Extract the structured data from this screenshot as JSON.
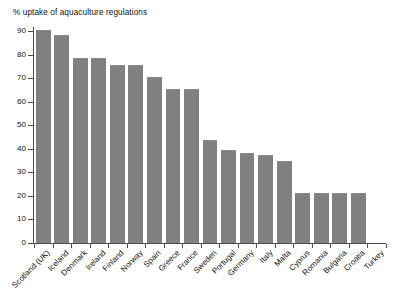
{
  "chart_data": {
    "type": "bar",
    "title": "% uptake of aquaculture regulations",
    "xlabel": "",
    "ylabel": "",
    "ylim": [
      0,
      90
    ],
    "ytick_step": 10,
    "yticks": [
      0,
      10,
      20,
      30,
      40,
      50,
      60,
      70,
      80,
      90
    ],
    "ytick_labels": [
      "0",
      "10",
      "20",
      "30",
      "40",
      "50",
      "60",
      "70",
      "80",
      "90"
    ],
    "grid": false,
    "legend": false,
    "legend_position": "none",
    "bar_color": "#808080",
    "axis_color": "#4d4d4d",
    "background_color": "#ffffff",
    "xtick_label_rotation": -45,
    "categories": [
      "Scotland (UK)",
      "Iceland",
      "Denmark",
      "Ireland",
      "Finland",
      "Norway",
      "Spain",
      "Greece",
      "France",
      "Sweden",
      "Portugal",
      "Germany",
      "Italy",
      "Malta",
      "Cyprus",
      "Romania",
      "Bulgaria",
      "Croatia",
      "Turkey"
    ],
    "values": [
      90,
      88,
      78,
      78,
      75,
      75,
      70,
      65,
      65,
      43.5,
      39,
      38,
      37,
      34.5,
      21,
      21,
      21,
      21,
      0
    ]
  }
}
